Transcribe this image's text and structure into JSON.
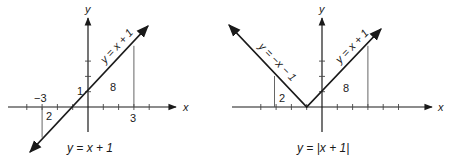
{
  "left_graph": {
    "axis_x_label": "x",
    "axis_y_label": "y",
    "line_label": "y = x + 1",
    "caption": "y = x + 1",
    "tick_labels": {
      "neg3": "−3",
      "pos3": "3",
      "y_intercept": "1"
    },
    "area_labels": {
      "left": "2",
      "right": "8"
    }
  },
  "right_graph": {
    "axis_x_label": "x",
    "axis_y_label": "y",
    "left_branch_label": "y = −x − 1",
    "right_branch_label": "y = x + 1",
    "caption": "y = |x + 1|",
    "area_labels": {
      "left": "2",
      "right": "8"
    }
  },
  "colors": {
    "ink": "#1a1a1a",
    "guide": "#555555",
    "background": "#ffffff"
  }
}
